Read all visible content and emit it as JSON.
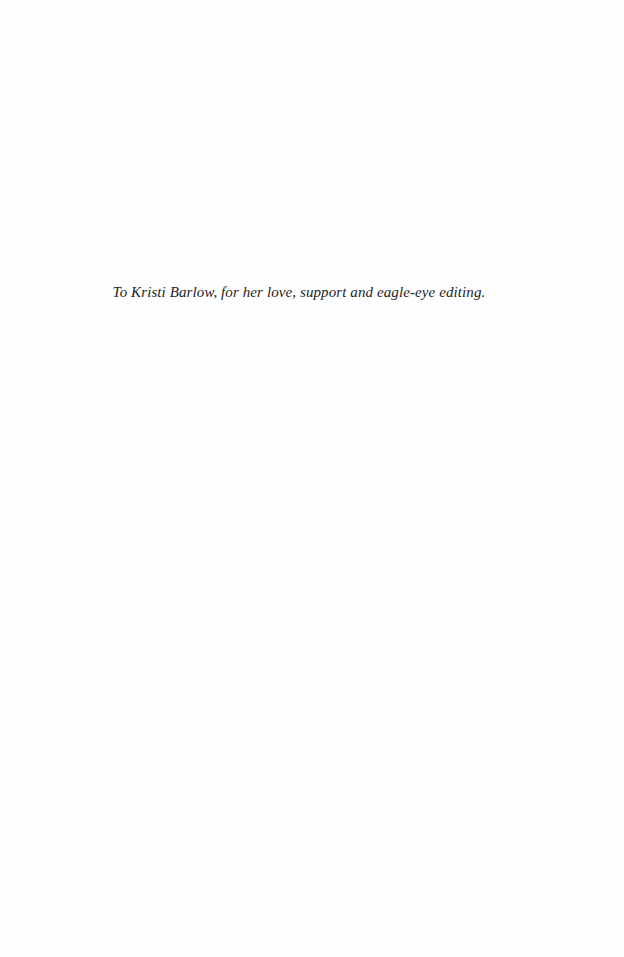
{
  "page": {
    "type": "dedication",
    "text": "To Kristi Barlow, for her love, support and eagle-eye editing."
  }
}
